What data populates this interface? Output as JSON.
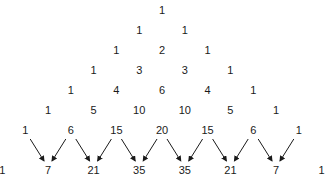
{
  "diagram": {
    "type": "pascals-triangle",
    "rows": [
      [
        1
      ],
      [
        1,
        1
      ],
      [
        1,
        2,
        1
      ],
      [
        1,
        3,
        3,
        1
      ],
      [
        1,
        4,
        6,
        4,
        1
      ],
      [
        1,
        5,
        10,
        10,
        5,
        1
      ],
      [
        1,
        6,
        15,
        20,
        15,
        6,
        1
      ],
      [
        1,
        7,
        21,
        35,
        35,
        21,
        7,
        1
      ]
    ],
    "layout": {
      "center_x": 162,
      "col_spacing": 45.6,
      "row_y": [
        10,
        30,
        50,
        70,
        90,
        110,
        130,
        170
      ]
    },
    "arrows": {
      "from_row": 6,
      "to_row": 7,
      "color": "#1a1a1a",
      "description": "Each adjacent pair in row 6 points to the sum below in row 7"
    }
  }
}
